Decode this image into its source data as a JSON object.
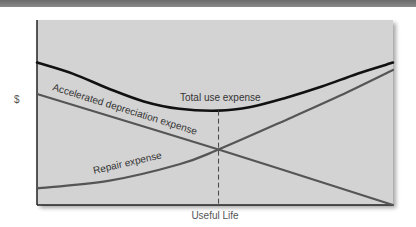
{
  "chart_data": {
    "type": "line",
    "title": "",
    "xlabel": "Useful Life",
    "ylabel": "$",
    "x_domain": [
      0,
      1
    ],
    "y_domain": [
      0,
      1
    ],
    "grid": false,
    "legend": "none (inline curve labels)",
    "optimal_point_x": 0.51,
    "series": [
      {
        "name": "Total use expense",
        "label": "Total use expense",
        "color": "#111111",
        "points": [
          [
            0,
            0.77
          ],
          [
            0.1,
            0.71
          ],
          [
            0.2,
            0.63
          ],
          [
            0.3,
            0.56
          ],
          [
            0.4,
            0.52
          ],
          [
            0.51,
            0.51
          ],
          [
            0.6,
            0.53
          ],
          [
            0.7,
            0.58
          ],
          [
            0.8,
            0.64
          ],
          [
            0.9,
            0.71
          ],
          [
            1.0,
            0.77
          ]
        ]
      },
      {
        "name": "Accelerated depreciation expense",
        "label": "Accelerated  depreciation  expense",
        "color": "#555555",
        "points": [
          [
            0,
            0.6
          ],
          [
            0.51,
            0.3
          ],
          [
            1.0,
            0.0
          ]
        ]
      },
      {
        "name": "Repair expense",
        "label": "Repair  expense",
        "color": "#555555",
        "points": [
          [
            0,
            0.09
          ],
          [
            0.2,
            0.13
          ],
          [
            0.4,
            0.22
          ],
          [
            0.51,
            0.3
          ],
          [
            0.7,
            0.46
          ],
          [
            0.85,
            0.59
          ],
          [
            1.0,
            0.73
          ]
        ]
      }
    ]
  },
  "page": {
    "top_bar_color": "#777777",
    "plot_background": "#d3d3d3"
  }
}
